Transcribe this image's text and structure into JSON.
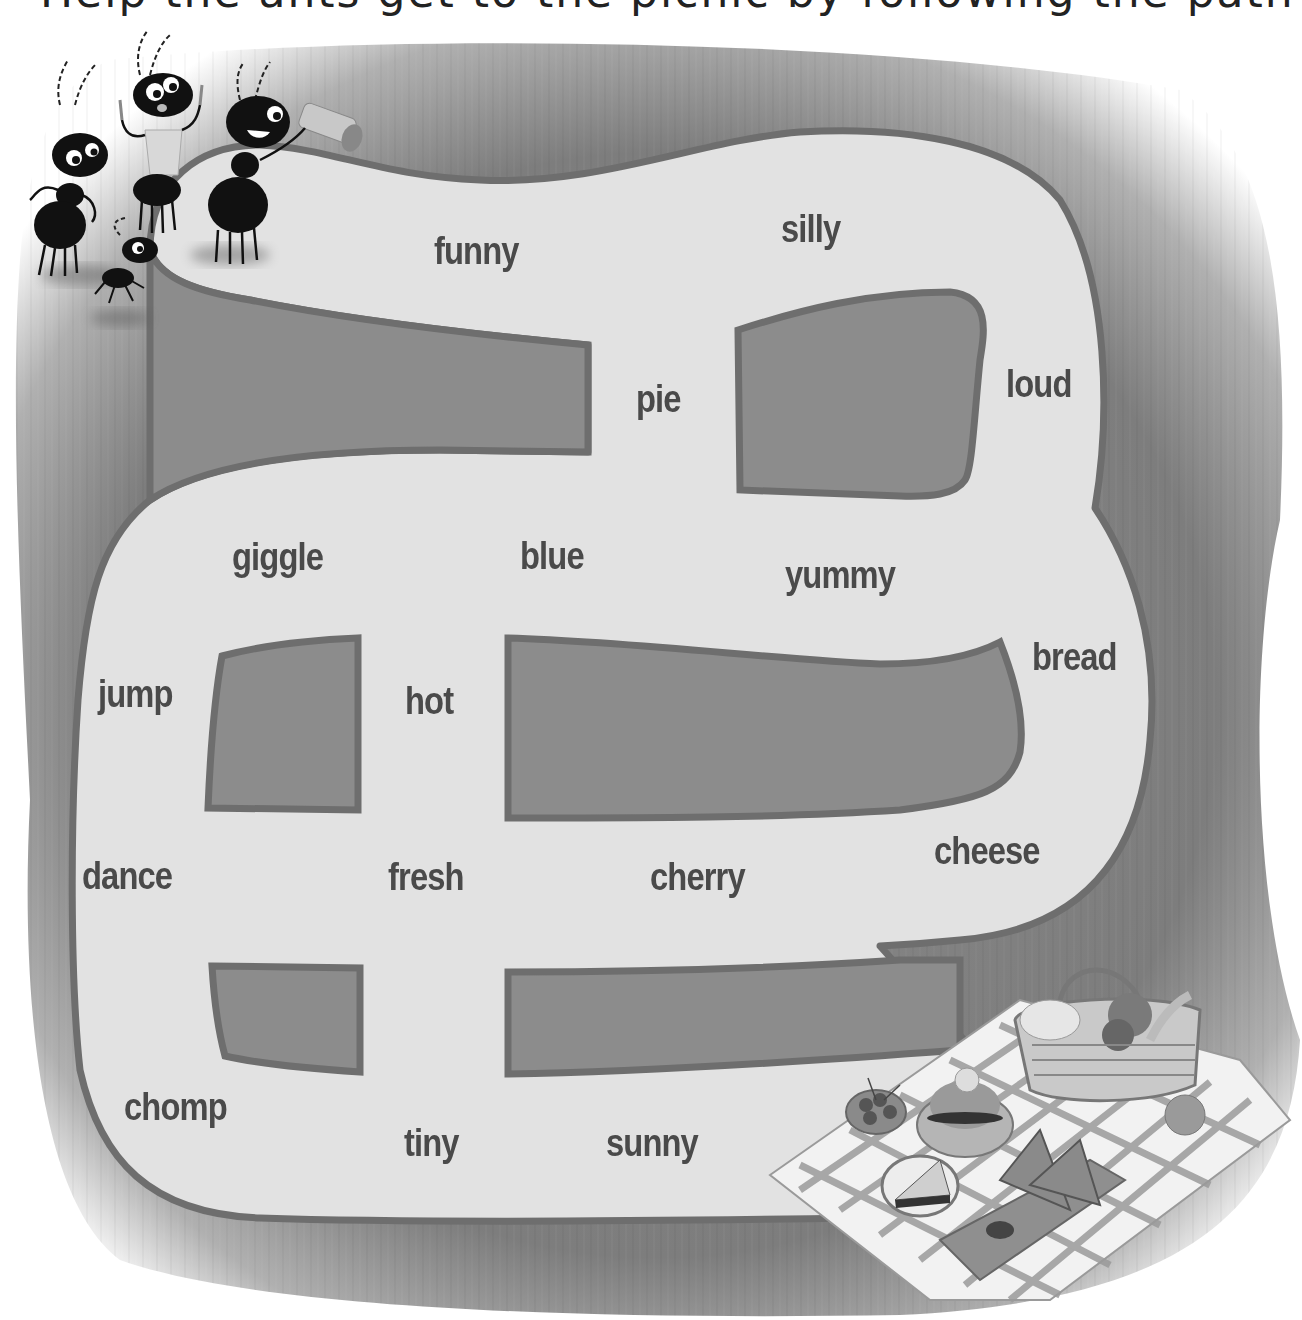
{
  "title_fragment": "Help the ants get to the picnic by following the path of describing words.",
  "colors": {
    "background_outer": "#ffffff",
    "wood": "#8c8c8c",
    "wood_dark": "#7a7a7a",
    "path_fill": "#e2e2e2",
    "path_border": "#6e6e6e",
    "word_text": "#4a4a4a"
  },
  "maze": {
    "start_label": "ants",
    "end_label": "picnic",
    "words": [
      {
        "text": "funny",
        "x": 434,
        "y": 232
      },
      {
        "text": "silly",
        "x": 781,
        "y": 210
      },
      {
        "text": "pie",
        "x": 636,
        "y": 380
      },
      {
        "text": "loud",
        "x": 1006,
        "y": 365
      },
      {
        "text": "giggle",
        "x": 232,
        "y": 538
      },
      {
        "text": "blue",
        "x": 520,
        "y": 537
      },
      {
        "text": "yummy",
        "x": 785,
        "y": 556
      },
      {
        "text": "bread",
        "x": 1032,
        "y": 638
      },
      {
        "text": "jump",
        "x": 98,
        "y": 675
      },
      {
        "text": "hot",
        "x": 405,
        "y": 682
      },
      {
        "text": "dance",
        "x": 82,
        "y": 857
      },
      {
        "text": "fresh",
        "x": 388,
        "y": 858
      },
      {
        "text": "cherry",
        "x": 650,
        "y": 858
      },
      {
        "text": "cheese",
        "x": 934,
        "y": 832
      },
      {
        "text": "chomp",
        "x": 124,
        "y": 1088
      },
      {
        "text": "tiny",
        "x": 404,
        "y": 1124
      },
      {
        "text": "sunny",
        "x": 606,
        "y": 1124
      }
    ]
  },
  "illustrations": {
    "ants": {
      "count": 4,
      "items": [
        "ant-with-fork-and-knife",
        "ant-with-bib",
        "ant-with-telescope",
        "small-ant"
      ]
    },
    "picnic": {
      "items": [
        "checkered-blanket",
        "picnic-basket",
        "bowl-of-cherries",
        "burger",
        "pie-slice",
        "watermelon-slices",
        "cutting-board",
        "orange"
      ]
    }
  }
}
